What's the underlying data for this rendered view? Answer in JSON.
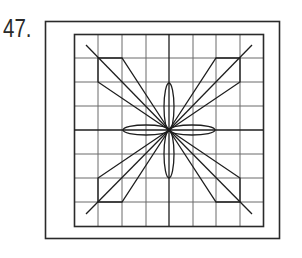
{
  "figure": {
    "number_label": "47.",
    "colors": {
      "line": "#1e1e1e",
      "grid": "#6a6a6a",
      "frame": "#2a2a2a",
      "background": "#ffffff"
    },
    "outer_frame": {
      "x": 45,
      "y": 21,
      "width": 234,
      "height": 217
    },
    "grid": {
      "x": 74,
      "y": 34,
      "width": 189,
      "height": 192,
      "columns": 8,
      "rows": 8
    },
    "center": {
      "x": 169,
      "y": 130
    },
    "petals": [
      {
        "orientation": "horizontal-left",
        "cx": 146,
        "cy": 130,
        "rx": 23,
        "ry": 5
      },
      {
        "orientation": "horizontal-right",
        "cx": 192,
        "cy": 130,
        "rx": 23,
        "ry": 5
      },
      {
        "orientation": "vertical-top",
        "cx": 169,
        "cy": 107,
        "rx": 5,
        "ry": 24
      },
      {
        "orientation": "vertical-bottom",
        "cx": 169,
        "cy": 154,
        "rx": 5,
        "ry": 24
      }
    ]
  }
}
